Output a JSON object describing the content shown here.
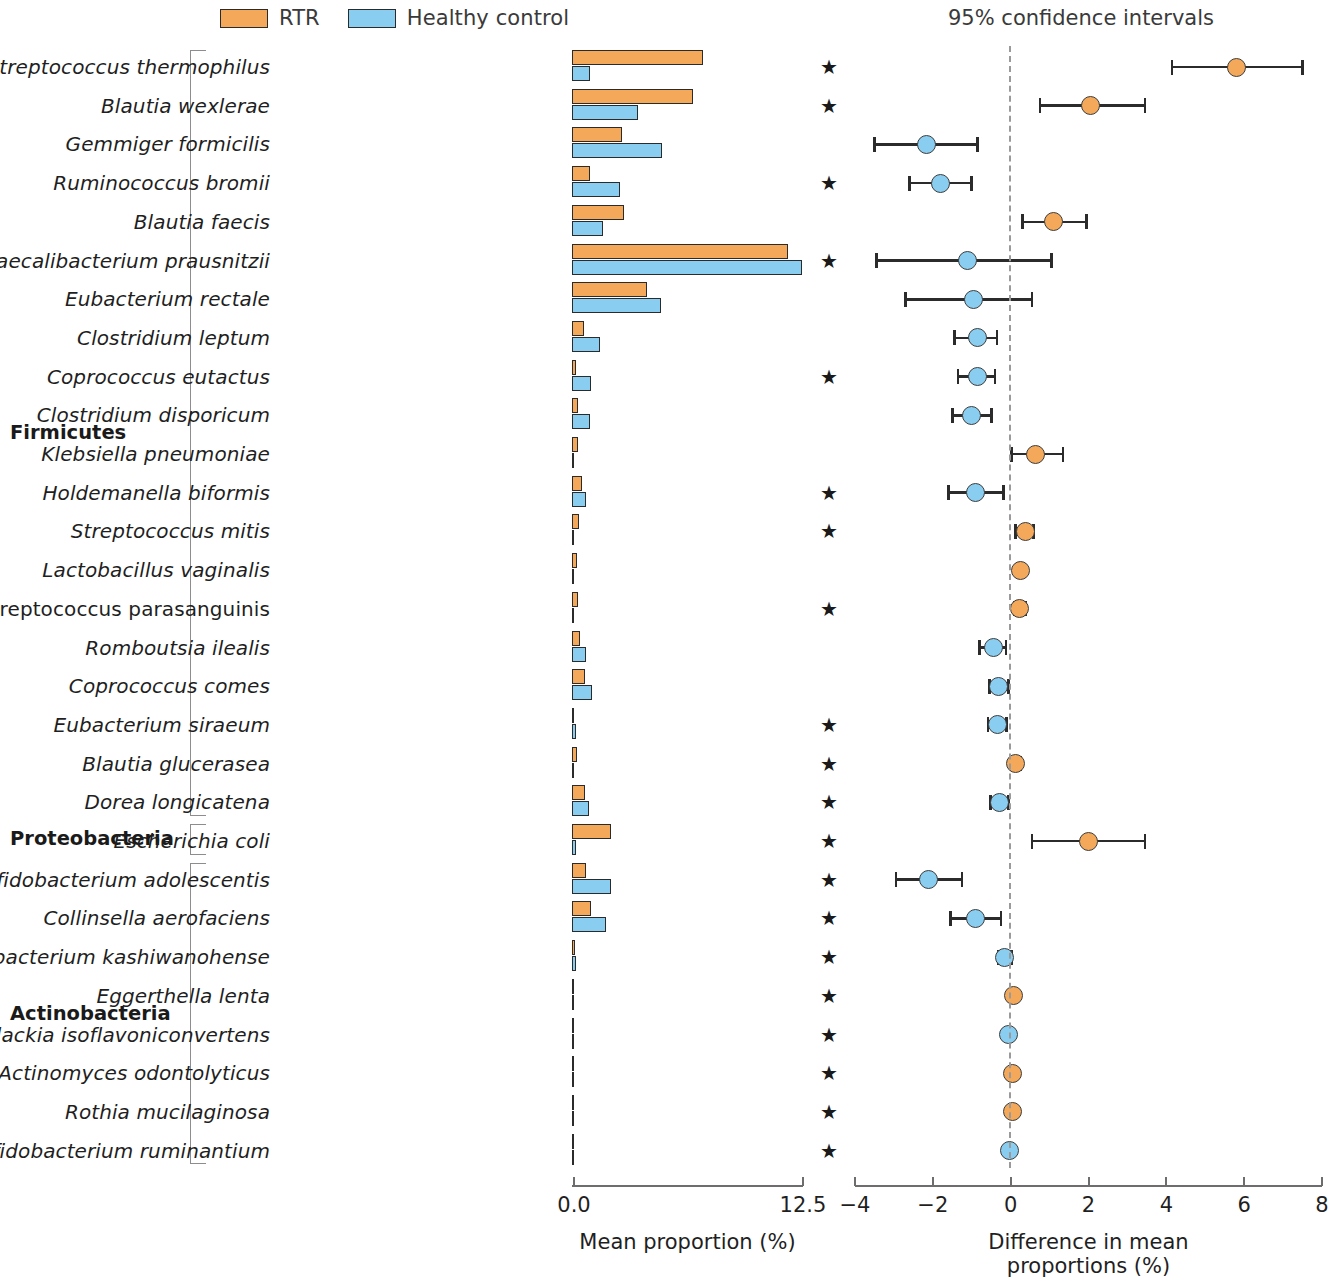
{
  "legend": {
    "items": [
      {
        "label": "RTR",
        "color": "#f4a85a",
        "icon": "legend-swatch"
      },
      {
        "label": "Healthy control",
        "color": "#89cdf0",
        "icon": "legend-swatch"
      }
    ]
  },
  "ci_panel_title": "95% confidence intervals",
  "phyla": [
    {
      "name": "Firmicutes",
      "first_row": 0,
      "last_row": 19
    },
    {
      "name": "Proteobacteria",
      "first_row": 20,
      "last_row": 20
    },
    {
      "name": "Actinobacteria",
      "first_row": 21,
      "last_row": 28
    }
  ],
  "significance_marker": "★",
  "chart_data": {
    "type": "bar",
    "title": "",
    "subtitle": "",
    "panels": [
      {
        "name": "mean-proportion-panel",
        "type": "bar",
        "xlabel": "Mean proportion (%)",
        "xlim": [
          0.0,
          12.5
        ],
        "xticks": [
          0.0,
          12.5
        ],
        "xticklabels": [
          "0.0",
          "12.5"
        ],
        "grid": false,
        "series": [
          {
            "name": "RTR",
            "color": "#f4a85a"
          },
          {
            "name": "Healthy control",
            "color": "#89cdf0"
          }
        ]
      },
      {
        "name": "difference-in-mean-proportions-panel",
        "type": "scatter",
        "xlabel": "Difference in mean proportions (%)",
        "xlim": [
          -4,
          8
        ],
        "xticks": [
          -4,
          -2,
          0,
          2,
          4,
          6,
          8
        ],
        "xticklabels": [
          "−4",
          "−2",
          "0",
          "2",
          "4",
          "6",
          "8"
        ],
        "grid": false,
        "zero_reference_line": 0,
        "error_bar_label": "95% confidence intervals"
      }
    ],
    "categories": [
      "Streptococcus thermophilus",
      "Blautia wexlerae",
      "Gemmiger formicilis",
      "Ruminococcus bromii",
      "Blautia faecis",
      "Faecalibacterium prausnitzii",
      "Eubacterium rectale",
      "Clostridium leptum",
      "Coprococcus eutactus",
      "Clostridium disporicum",
      "Klebsiella pneumoniae",
      "Holdemanella biformis",
      "Streptococcus mitis",
      "Lactobacillus vaginalis",
      "Streptococcus parasanguinis",
      "Romboutsia ilealis",
      "Coprococcus comes",
      "Eubacterium siraeum",
      "Blautia glucerasea",
      "Dorea longicatena",
      "Escherichia coli",
      "Bifidobacterium adolescentis",
      "Collinsella aerofaciens",
      "Bifidobacterium kashiwanohense",
      "Eggerthella lenta",
      "Slackia isoflavoniconvertens",
      "Actinomyces odontolyticus",
      "Rothia mucilaginosa",
      "Bifidobacterium ruminantium"
    ],
    "rows": [
      {
        "species": "Streptococcus thermophilus",
        "italic": true,
        "phylum": "Firmicutes",
        "rtr": 7.1,
        "hc": 0.95,
        "diff": 5.8,
        "ci_low": 4.15,
        "ci_high": 7.5,
        "dot_color": "#f4a85a",
        "significant": true
      },
      {
        "species": "Blautia wexlerae",
        "italic": true,
        "phylum": "Firmicutes",
        "rtr": 6.55,
        "hc": 3.55,
        "diff": 2.05,
        "ci_low": 0.75,
        "ci_high": 3.45,
        "dot_color": "#f4a85a",
        "significant": true
      },
      {
        "species": "Gemmiger formicilis",
        "italic": true,
        "phylum": "Firmicutes",
        "rtr": 2.7,
        "hc": 4.85,
        "diff": -2.15,
        "ci_low": -3.5,
        "ci_high": -0.85,
        "dot_color": "#89cdf0",
        "significant": false
      },
      {
        "species": "Ruminococcus bromii",
        "italic": true,
        "phylum": "Firmicutes",
        "rtr": 1.0,
        "hc": 2.6,
        "diff": -1.8,
        "ci_low": -2.6,
        "ci_high": -1.0,
        "dot_color": "#89cdf0",
        "significant": true
      },
      {
        "species": "Blautia faecis",
        "italic": true,
        "phylum": "Firmicutes",
        "rtr": 2.8,
        "hc": 1.7,
        "diff": 1.1,
        "ci_low": 0.3,
        "ci_high": 1.95,
        "dot_color": "#f4a85a",
        "significant": false
      },
      {
        "species": "Faecalibacterium prausnitzii",
        "italic": true,
        "phylum": "Firmicutes",
        "rtr": 11.7,
        "hc": 12.45,
        "diff": -1.1,
        "ci_low": -3.45,
        "ci_high": 1.05,
        "dot_color": "#89cdf0",
        "significant": true
      },
      {
        "species": "Eubacterium rectale",
        "italic": true,
        "phylum": "Firmicutes",
        "rtr": 4.05,
        "hc": 4.8,
        "diff": -0.95,
        "ci_low": -2.7,
        "ci_high": 0.55,
        "dot_color": "#89cdf0",
        "significant": false
      },
      {
        "species": "Clostridium leptum",
        "italic": true,
        "phylum": "Firmicutes",
        "rtr": 0.65,
        "hc": 1.5,
        "diff": -0.85,
        "ci_low": -1.45,
        "ci_high": -0.35,
        "dot_color": "#89cdf0",
        "significant": false
      },
      {
        "species": "Coprococcus eutactus",
        "italic": true,
        "phylum": "Firmicutes",
        "rtr": 0.22,
        "hc": 1.05,
        "diff": -0.85,
        "ci_low": -1.35,
        "ci_high": -0.4,
        "dot_color": "#89cdf0",
        "significant": true
      },
      {
        "species": "Clostridium disporicum",
        "italic": true,
        "phylum": "Firmicutes",
        "rtr": 0.3,
        "hc": 0.95,
        "diff": -1.0,
        "ci_low": -1.5,
        "ci_high": -0.5,
        "dot_color": "#89cdf0",
        "significant": false
      },
      {
        "species": "Klebsiella pneumoniae",
        "italic": true,
        "phylum": "Firmicutes",
        "rtr": 0.3,
        "hc": 0.05,
        "diff": 0.65,
        "ci_low": 0.02,
        "ci_high": 1.35,
        "dot_color": "#f4a85a",
        "significant": false
      },
      {
        "species": "Holdemanella biformis",
        "italic": true,
        "phylum": "Firmicutes",
        "rtr": 0.55,
        "hc": 0.75,
        "diff": -0.9,
        "ci_low": -1.6,
        "ci_high": -0.18,
        "dot_color": "#89cdf0",
        "significant": true
      },
      {
        "species": "Streptococcus mitis",
        "italic": true,
        "phylum": "Firmicutes",
        "rtr": 0.38,
        "hc": 0.04,
        "diff": 0.38,
        "ci_low": 0.12,
        "ci_high": 0.58,
        "dot_color": "#f4a85a",
        "significant": true
      },
      {
        "species": "Lactobacillus vaginalis",
        "italic": true,
        "phylum": "Firmicutes",
        "rtr": 0.28,
        "hc": 0.04,
        "diff": 0.25,
        "ci_low": 0.14,
        "ci_high": 0.36,
        "dot_color": "#f4a85a",
        "significant": false
      },
      {
        "species": "Streptococcus parasanguinis",
        "italic": false,
        "phylum": "Firmicutes",
        "rtr": 0.32,
        "hc": 0.05,
        "diff": 0.22,
        "ci_low": 0.1,
        "ci_high": 0.38,
        "dot_color": "#f4a85a",
        "significant": true
      },
      {
        "species": "Romboutsia ilealis",
        "italic": true,
        "phylum": "Firmicutes",
        "rtr": 0.45,
        "hc": 0.75,
        "diff": -0.45,
        "ci_low": -0.8,
        "ci_high": -0.12,
        "dot_color": "#89cdf0",
        "significant": false
      },
      {
        "species": "Coprococcus comes",
        "italic": true,
        "phylum": "Firmicutes",
        "rtr": 0.7,
        "hc": 1.1,
        "diff": -0.3,
        "ci_low": -0.55,
        "ci_high": -0.05,
        "dot_color": "#89cdf0",
        "significant": false
      },
      {
        "species": "Eubacterium siraeum",
        "italic": true,
        "phylum": "Firmicutes",
        "rtr": 0.07,
        "hc": 0.22,
        "diff": -0.35,
        "ci_low": -0.58,
        "ci_high": -0.1,
        "dot_color": "#89cdf0",
        "significant": true
      },
      {
        "species": "Blautia glucerasea",
        "italic": true,
        "phylum": "Firmicutes",
        "rtr": 0.26,
        "hc": 0.06,
        "diff": 0.12,
        "ci_low": 0.02,
        "ci_high": 0.25,
        "dot_color": "#f4a85a",
        "significant": true
      },
      {
        "species": "Dorea longicatena",
        "italic": true,
        "phylum": "Firmicutes",
        "rtr": 0.7,
        "hc": 0.9,
        "diff": -0.28,
        "ci_low": -0.52,
        "ci_high": -0.05,
        "dot_color": "#89cdf0",
        "significant": true
      },
      {
        "species": "Escherichia coli",
        "italic": true,
        "phylum": "Proteobacteria",
        "rtr": 2.1,
        "hc": 0.22,
        "diff": 2.0,
        "ci_low": 0.55,
        "ci_high": 3.45,
        "dot_color": "#f4a85a",
        "significant": true
      },
      {
        "species": "Bifidobacterium adolescentis",
        "italic": true,
        "phylum": "Actinobacteria",
        "rtr": 0.75,
        "hc": 2.1,
        "diff": -2.1,
        "ci_low": -2.95,
        "ci_high": -1.25,
        "dot_color": "#89cdf0",
        "significant": true
      },
      {
        "species": "Collinsella aerofaciens",
        "italic": true,
        "phylum": "Actinobacteria",
        "rtr": 1.05,
        "hc": 1.85,
        "diff": -0.9,
        "ci_low": -1.55,
        "ci_high": -0.25,
        "dot_color": "#89cdf0",
        "significant": true
      },
      {
        "species": "Bifidobacterium kashiwanohense",
        "italic": true,
        "phylum": "Actinobacteria",
        "rtr": 0.14,
        "hc": 0.2,
        "diff": -0.15,
        "ci_low": -0.32,
        "ci_high": 0.02,
        "dot_color": "#89cdf0",
        "significant": true
      },
      {
        "species": "Eggerthella lenta",
        "italic": true,
        "phylum": "Actinobacteria",
        "rtr": 0.08,
        "hc": 0.02,
        "diff": 0.06,
        "ci_low": 0.06,
        "ci_high": 0.06,
        "dot_color": "#f4a85a",
        "significant": true
      },
      {
        "species": "Slackia isoflavoniconvertens",
        "italic": true,
        "phylum": "Actinobacteria",
        "rtr": 0.04,
        "hc": 0.09,
        "diff": -0.06,
        "ci_low": -0.06,
        "ci_high": -0.06,
        "dot_color": "#89cdf0",
        "significant": true
      },
      {
        "species": "Actinomyces odontolyticus",
        "italic": true,
        "phylum": "Actinobacteria",
        "rtr": 0.07,
        "hc": 0.01,
        "diff": 0.05,
        "ci_low": 0.05,
        "ci_high": 0.05,
        "dot_color": "#f4a85a",
        "significant": true
      },
      {
        "species": "Rothia mucilaginosa",
        "italic": true,
        "phylum": "Actinobacteria",
        "rtr": 0.07,
        "hc": 0.01,
        "diff": 0.05,
        "ci_low": 0.05,
        "ci_high": 0.05,
        "dot_color": "#f4a85a",
        "significant": true
      },
      {
        "species": "Bifidobacterium ruminantium",
        "italic": true,
        "phylum": "Actinobacteria",
        "rtr": 0.04,
        "hc": 0.08,
        "diff": -0.04,
        "ci_low": -0.04,
        "ci_high": -0.04,
        "dot_color": "#89cdf0",
        "significant": true
      }
    ]
  }
}
